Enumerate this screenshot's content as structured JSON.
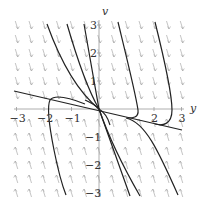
{
  "chart_data": {
    "type": "direction-field",
    "title": "",
    "xlabel": "y",
    "ylabel": "v",
    "xlim": [
      -3,
      3
    ],
    "ylim": [
      -3,
      3
    ],
    "xticks": [
      "−3",
      "−2",
      "−1",
      "2",
      "3"
    ],
    "yticks": [
      "3",
      "2",
      "1",
      "−1",
      "−2",
      "−3"
    ],
    "grid": false,
    "colors": {
      "arrows": "#aaaaaa",
      "curves": "#222222",
      "axes": "#999999"
    },
    "field_note": "arrows point downward above the y-axis and upward below it",
    "trajectories": [
      {
        "name": "straight-line-solution",
        "points": [
          [
            -3.1,
            0.65
          ],
          [
            3.0,
            -0.75
          ]
        ]
      },
      {
        "name": "steep-line-solution",
        "points": [
          [
            -0.55,
            3.0
          ],
          [
            1.1,
            -3.0
          ]
        ]
      }
    ]
  },
  "axes": {
    "x_label": "y",
    "y_label": "v",
    "x_ticks": [
      {
        "label": "−3",
        "value": -3
      },
      {
        "label": "−2",
        "value": -2
      },
      {
        "label": "−1",
        "value": -1
      },
      {
        "label": "2",
        "value": 2
      },
      {
        "label": "3",
        "value": 3
      }
    ],
    "y_ticks": [
      {
        "label": "3",
        "value": 3
      },
      {
        "label": "2",
        "value": 2
      },
      {
        "label": "1",
        "value": 1
      },
      {
        "label": "−1",
        "value": -1
      },
      {
        "label": "−2",
        "value": -2
      },
      {
        "label": "−3",
        "value": -3
      }
    ]
  }
}
